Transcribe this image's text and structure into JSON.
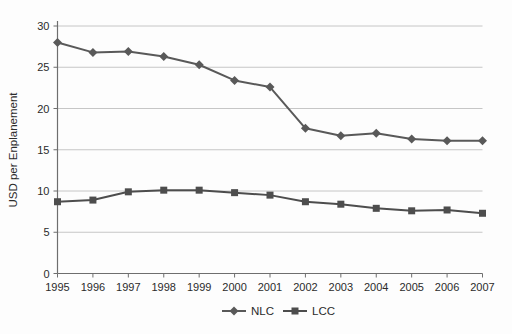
{
  "chart_data": {
    "type": "line",
    "title": "",
    "xlabel": "",
    "ylabel": "USD per Enplanement",
    "x": [
      1995,
      1996,
      1997,
      1998,
      1999,
      2000,
      2001,
      2002,
      2003,
      2004,
      2005,
      2006,
      2007
    ],
    "series": [
      {
        "name": "NLC",
        "marker": "diamond",
        "color": "#595959",
        "values": [
          28.0,
          26.8,
          26.9,
          26.3,
          25.3,
          23.4,
          22.6,
          17.6,
          16.7,
          17.0,
          16.3,
          16.1,
          16.1
        ]
      },
      {
        "name": "LCC",
        "marker": "square",
        "color": "#4d4d4d",
        "values": [
          8.7,
          8.9,
          9.9,
          10.1,
          10.1,
          9.8,
          9.5,
          8.7,
          8.4,
          7.9,
          7.6,
          7.7,
          7.3
        ]
      }
    ],
    "ylim": [
      0,
      30
    ],
    "yticks": [
      0,
      5,
      10,
      15,
      20,
      25,
      30
    ],
    "grid": "horizontal",
    "legend_position": "bottom",
    "colors": {
      "gridline": "#c6c6c6",
      "axis": "#6e6e6e",
      "text": "#2b2b2b",
      "background": "#fdfdfd"
    }
  }
}
